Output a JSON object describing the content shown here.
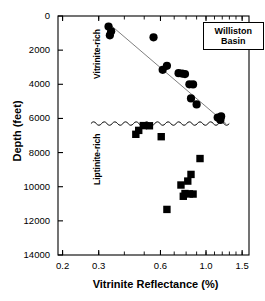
{
  "chart_data": {
    "type": "scatter",
    "title": "",
    "xlabel": "Vitrinite Reflectance (%)",
    "ylabel": "Depth (feet)",
    "xscale": "log",
    "yscale": "linear",
    "xlim": [
      0.19,
      1.62
    ],
    "ylim": [
      14000,
      0
    ],
    "y_inverted": true,
    "grid": false,
    "xticks": [
      0.2,
      0.3,
      0.6,
      1.0,
      1.5
    ],
    "xticklabels": [
      "0.2",
      "0.3",
      "0.6",
      "1.0",
      "1.5"
    ],
    "xminorticks": [
      0.2,
      0.3,
      0.4,
      0.5,
      0.6,
      0.7,
      0.8,
      0.9,
      1.0,
      1.1,
      1.2,
      1.3,
      1.4,
      1.5
    ],
    "yticks": [
      0,
      2000,
      4000,
      6000,
      8000,
      10000,
      12000,
      14000
    ],
    "yticklabels": [
      "0",
      "2000",
      "4000",
      "6000",
      "8000",
      "10000",
      "12000",
      "14000"
    ],
    "legend_position": "top-right",
    "annotations": [
      {
        "name": "williston-basin-box",
        "text": "Williston Basin",
        "lines": [
          "Williston",
          "Basin"
        ],
        "x": 1.02,
        "y": 1150
      },
      {
        "name": "vitrinite-rich-zone",
        "text": "Vitrinite-rich",
        "x": 0.265,
        "y": 3700,
        "rotation": 90
      },
      {
        "name": "liptinite-rich-zone",
        "text": "Liptinite-rich",
        "x": 0.265,
        "y": 9900,
        "rotation": 90
      }
    ],
    "series": [
      {
        "name": "Vitrinite-rich",
        "marker": "circle",
        "color": "#000000",
        "points": [
          {
            "x": 0.335,
            "y": 620
          },
          {
            "x": 0.345,
            "y": 900
          },
          {
            "x": 0.34,
            "y": 1130
          },
          {
            "x": 0.555,
            "y": 1250
          },
          {
            "x": 0.615,
            "y": 3150
          },
          {
            "x": 0.645,
            "y": 2920
          },
          {
            "x": 0.735,
            "y": 3350
          },
          {
            "x": 0.765,
            "y": 3370
          },
          {
            "x": 0.79,
            "y": 3400
          },
          {
            "x": 0.83,
            "y": 4000
          },
          {
            "x": 0.865,
            "y": 4010
          },
          {
            "x": 0.845,
            "y": 4830
          },
          {
            "x": 0.9,
            "y": 5180
          },
          {
            "x": 1.14,
            "y": 5950
          },
          {
            "x": 1.185,
            "y": 5880
          },
          {
            "x": 1.175,
            "y": 6090
          }
        ]
      },
      {
        "name": "Liptinite-rich",
        "marker": "square",
        "color": "#000000",
        "points": [
          {
            "x": 0.495,
            "y": 6420
          },
          {
            "x": 0.53,
            "y": 6430
          },
          {
            "x": 0.47,
            "y": 6700
          },
          {
            "x": 0.455,
            "y": 6930
          },
          {
            "x": 0.605,
            "y": 7070
          },
          {
            "x": 0.935,
            "y": 8350
          },
          {
            "x": 0.845,
            "y": 9280
          },
          {
            "x": 0.815,
            "y": 9670
          },
          {
            "x": 0.755,
            "y": 9900
          },
          {
            "x": 0.79,
            "y": 10400
          },
          {
            "x": 0.83,
            "y": 10420
          },
          {
            "x": 0.865,
            "y": 10430
          },
          {
            "x": 0.775,
            "y": 10560
          },
          {
            "x": 0.645,
            "y": 11330
          }
        ]
      }
    ],
    "trendline": {
      "name": "vitrinite-trend",
      "color": "#808080",
      "from": {
        "x": 0.335,
        "y": 430
      },
      "to": {
        "x": 1.255,
        "y": 6320
      }
    },
    "boundary": {
      "name": "unconformity-wavy-line",
      "style": "wavy",
      "y": 6300,
      "x_from": 0.275,
      "x_to": 1.3
    }
  }
}
